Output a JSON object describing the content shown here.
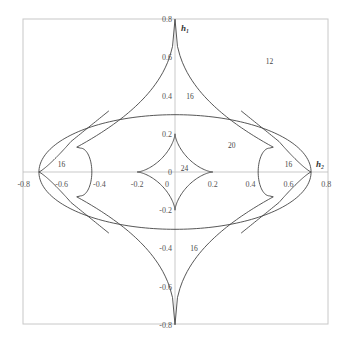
{
  "chart_data": {
    "type": "diagram",
    "title": "",
    "xlabel": "h₂",
    "ylabel": "h₁",
    "xlim": [
      -0.8,
      0.8
    ],
    "ylim": [
      -0.8,
      0.8
    ],
    "x_ticks": [
      "-0.8",
      "-0.6",
      "-0.4",
      "-0.2",
      "0",
      "0.2",
      "0.4",
      "0.6",
      "0.8"
    ],
    "y_ticks": [
      "0.8",
      "0.6",
      "0.4",
      "0.2",
      "0",
      "-0.2",
      "-0.4",
      "-0.6",
      "-0.8"
    ],
    "curves": [
      {
        "name": "ellipse",
        "center": [
          0,
          0
        ],
        "semi_x": 0.72,
        "semi_y": 0.3
      },
      {
        "name": "inner-astroid",
        "center": [
          0,
          0
        ],
        "radius": 0.2
      },
      {
        "name": "outer-four-cusp-curve",
        "cusps": [
          [
            0,
            0.8
          ],
          [
            0,
            -0.8
          ],
          [
            0.72,
            0
          ],
          [
            -0.72,
            0
          ]
        ]
      }
    ],
    "region_labels": [
      {
        "text": "12",
        "x": 0.5,
        "y": 0.58
      },
      {
        "text": "16",
        "x": 0.08,
        "y": 0.4
      },
      {
        "text": "20",
        "x": 0.3,
        "y": 0.14
      },
      {
        "text": "24",
        "x": 0.05,
        "y": 0.02
      },
      {
        "text": "16",
        "x": -0.6,
        "y": 0.04
      },
      {
        "text": "16",
        "x": 0.6,
        "y": 0.04
      },
      {
        "text": "16",
        "x": 0.1,
        "y": -0.4
      }
    ]
  },
  "labels": {
    "x_axis": "h₂",
    "y_axis": "h₁",
    "origin": "0",
    "origin_below": "0"
  }
}
